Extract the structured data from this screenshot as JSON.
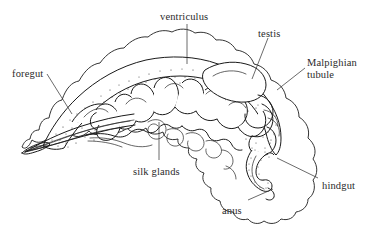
{
  "figure": {
    "kind": "anatomical-diagram",
    "background_color": "#ffffff",
    "ink_color": "#1a1a1a",
    "text_color": "#2b2b2b"
  },
  "labels": [
    {
      "id": "ventriculus",
      "text": "ventriculus",
      "x": 160,
      "y": 11,
      "align": "left",
      "lines": 1
    },
    {
      "id": "testis",
      "text": "testis",
      "x": 258,
      "y": 28,
      "align": "left",
      "lines": 1
    },
    {
      "id": "malpighian-tubule",
      "text": "Malpighian tubule",
      "x": 307,
      "y": 57,
      "align": "left",
      "lines": 2
    },
    {
      "id": "foregut",
      "text": "foregut",
      "x": 12,
      "y": 68,
      "align": "left",
      "lines": 1
    },
    {
      "id": "silk-glands",
      "text": "silk glands",
      "x": 133,
      "y": 166,
      "align": "left",
      "lines": 1
    },
    {
      "id": "hindgut",
      "text": "hindgut",
      "x": 322,
      "y": 180,
      "align": "left",
      "lines": 1
    },
    {
      "id": "anus",
      "text": "anus",
      "x": 222,
      "y": 205,
      "align": "left",
      "lines": 1
    }
  ],
  "leader_lines": [
    {
      "id": "leader-ventriculus",
      "from": [
        187,
        24
      ],
      "to": [
        187,
        64
      ]
    },
    {
      "id": "leader-testis",
      "from": [
        268,
        38
      ],
      "to": [
        252,
        79
      ]
    },
    {
      "id": "leader-malpighian-tubule",
      "from": [
        305,
        68
      ],
      "to": [
        277,
        90
      ]
    },
    {
      "id": "leader-foregut",
      "from": [
        47,
        74
      ],
      "to": [
        72,
        114
      ]
    },
    {
      "id": "leader-silk-glands",
      "from": [
        159,
        160
      ],
      "to": [
        159,
        122
      ]
    },
    {
      "id": "leader-hindgut",
      "from": [
        318,
        178
      ],
      "to": [
        277,
        158
      ]
    },
    {
      "id": "leader-anus",
      "from": [
        248,
        200
      ],
      "to": [
        273,
        189
      ]
    }
  ],
  "structures": [
    {
      "id": "body-outline",
      "name": "larval body wall outline, scalloped segmental margin"
    },
    {
      "id": "ventriculus",
      "name": "midgut / ventriculus, stippled elongate sac"
    },
    {
      "id": "foregut",
      "name": "foregut, anterior tapering tube at head end"
    },
    {
      "id": "silk-glands",
      "name": "paired coiled silk glands running ventrally"
    },
    {
      "id": "testis",
      "name": "testis, smooth oval body dorso-posterior"
    },
    {
      "id": "malpighian-tubules",
      "name": "Malpighian tubules, looping thin tubules posterior"
    },
    {
      "id": "hindgut",
      "name": "hindgut, stippled descending tube to anus"
    },
    {
      "id": "anus",
      "name": "anus, terminal opening at posterior ventral margin"
    }
  ]
}
